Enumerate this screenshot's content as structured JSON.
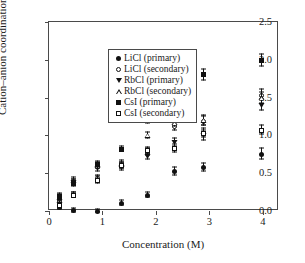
{
  "chart_data": {
    "type": "scatter",
    "title": "",
    "xlabel": "Concentration (M)",
    "ylabel": "Cation–anion coordination number",
    "xlim": [
      0,
      4.3
    ],
    "ylim": [
      0,
      2.5
    ],
    "xticks": [
      0,
      1,
      2,
      3,
      4
    ],
    "xtick_labels": [
      "0",
      "1",
      "2",
      "3",
      "4"
    ],
    "yticks": [
      0.0,
      0.5,
      1.0,
      1.5,
      2.0,
      2.5
    ],
    "ytick_labels": [
      "0.0",
      "0.5",
      "1.0",
      "1.5",
      "2.0",
      "2.5"
    ],
    "grid": false,
    "legend_position": "upper left",
    "error_bars": "y",
    "series": [
      {
        "name": "LiCl (primary)",
        "marker": "filled-circle",
        "color": "#111111",
        "points": [
          {
            "x": 0.2,
            "y": 0.05,
            "yerr": 0.04
          },
          {
            "x": 0.45,
            "y": 0.01,
            "yerr": 0.03
          },
          {
            "x": 0.9,
            "y": 0.0,
            "yerr": 0.03
          },
          {
            "x": 1.35,
            "y": 0.1,
            "yerr": 0.04
          },
          {
            "x": 1.85,
            "y": 0.21,
            "yerr": 0.04
          },
          {
            "x": 2.35,
            "y": 0.52,
            "yerr": 0.06
          },
          {
            "x": 2.88,
            "y": 0.57,
            "yerr": 0.06
          },
          {
            "x": 3.98,
            "y": 0.75,
            "yerr": 0.08
          }
        ]
      },
      {
        "name": "LiCl (secondary)",
        "marker": "open-circle",
        "color": "#111111",
        "points": [
          {
            "x": 0.2,
            "y": 0.12,
            "yerr": 0.05
          },
          {
            "x": 0.45,
            "y": 0.21,
            "yerr": 0.04
          },
          {
            "x": 0.9,
            "y": 0.43,
            "yerr": 0.05
          },
          {
            "x": 1.35,
            "y": 0.6,
            "yerr": 0.05
          },
          {
            "x": 1.85,
            "y": 0.78,
            "yerr": 0.05
          },
          {
            "x": 2.35,
            "y": 1.12,
            "yerr": 0.06
          },
          {
            "x": 2.88,
            "y": 1.19,
            "yerr": 0.07
          },
          {
            "x": 3.98,
            "y": 1.53,
            "yerr": 0.08
          }
        ]
      },
      {
        "name": "RbCl (primary)",
        "marker": "filled-triangle-down",
        "color": "#111111",
        "points": [
          {
            "x": 0.2,
            "y": 0.09,
            "yerr": 0.04
          },
          {
            "x": 0.45,
            "y": 0.38,
            "yerr": 0.05
          },
          {
            "x": 0.9,
            "y": 0.56,
            "yerr": 0.05
          },
          {
            "x": 1.35,
            "y": 0.58,
            "yerr": 0.05
          },
          {
            "x": 1.85,
            "y": 0.72,
            "yerr": 0.05
          },
          {
            "x": 2.35,
            "y": 0.9,
            "yerr": 0.06
          },
          {
            "x": 2.88,
            "y": 1.0,
            "yerr": 0.07
          },
          {
            "x": 3.98,
            "y": 1.4,
            "yerr": 0.08
          }
        ]
      },
      {
        "name": "RbCl (secondary)",
        "marker": "open-triangle-up",
        "color": "#111111",
        "points": [
          {
            "x": 0.2,
            "y": 0.18,
            "yerr": 0.05
          },
          {
            "x": 0.45,
            "y": 0.4,
            "yerr": 0.05
          },
          {
            "x": 0.9,
            "y": 0.6,
            "yerr": 0.05
          },
          {
            "x": 1.35,
            "y": 0.62,
            "yerr": 0.05
          },
          {
            "x": 1.85,
            "y": 1.0,
            "yerr": 0.05
          },
          {
            "x": 2.35,
            "y": 1.17,
            "yerr": 0.06
          },
          {
            "x": 2.88,
            "y": 1.2,
            "yerr": 0.07
          },
          {
            "x": 3.98,
            "y": 1.5,
            "yerr": 0.08
          }
        ]
      },
      {
        "name": "CsI (primary)",
        "marker": "filled-square",
        "color": "#111111",
        "points": [
          {
            "x": 0.2,
            "y": 0.19,
            "yerr": 0.05
          },
          {
            "x": 0.45,
            "y": 0.37,
            "yerr": 0.05
          },
          {
            "x": 0.9,
            "y": 0.61,
            "yerr": 0.05
          },
          {
            "x": 1.35,
            "y": 0.82,
            "yerr": 0.04
          },
          {
            "x": 1.85,
            "y": 1.21,
            "yerr": 0.06
          },
          {
            "x": 2.35,
            "y": 1.62,
            "yerr": 0.07
          },
          {
            "x": 2.88,
            "y": 1.8,
            "yerr": 0.08
          },
          {
            "x": 3.98,
            "y": 1.99,
            "yerr": 0.09
          }
        ]
      },
      {
        "name": "CsI (secondary)",
        "marker": "open-square",
        "color": "#111111",
        "points": [
          {
            "x": 0.2,
            "y": 0.07,
            "yerr": 0.04
          },
          {
            "x": 0.45,
            "y": 0.21,
            "yerr": 0.04
          },
          {
            "x": 0.9,
            "y": 0.41,
            "yerr": 0.05
          },
          {
            "x": 1.35,
            "y": 0.6,
            "yerr": 0.05
          },
          {
            "x": 1.85,
            "y": 0.8,
            "yerr": 0.05
          },
          {
            "x": 2.35,
            "y": 0.83,
            "yerr": 0.06
          },
          {
            "x": 2.88,
            "y": 1.03,
            "yerr": 0.07
          },
          {
            "x": 3.98,
            "y": 1.07,
            "yerr": 0.07
          }
        ]
      }
    ]
  }
}
